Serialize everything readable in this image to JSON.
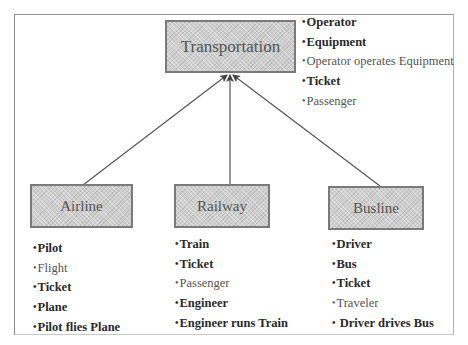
{
  "diagram": {
    "root": {
      "label": "Transportation",
      "attributes": [
        {
          "text": "Operator",
          "bold": true
        },
        {
          "text": "Equipment",
          "bold": true
        },
        {
          "text": "Operator operates Equipment",
          "bold": false
        },
        {
          "text": "Ticket",
          "bold": true
        },
        {
          "text": "Passenger",
          "bold": false
        }
      ]
    },
    "children": [
      {
        "label": "Airline",
        "attributes": [
          {
            "text": "Pilot",
            "bold": true
          },
          {
            "text": "Flight",
            "bold": false
          },
          {
            "text": "Ticket",
            "bold": true
          },
          {
            "text": "Plane",
            "bold": true
          },
          {
            "text": "Pilot flies Plane",
            "bold": true
          }
        ]
      },
      {
        "label": "Railway",
        "attributes": [
          {
            "text": "Train",
            "bold": true
          },
          {
            "text": "Ticket",
            "bold": true
          },
          {
            "text": "Passenger",
            "bold": false
          },
          {
            "text": "Engineer",
            "bold": true
          },
          {
            "text": "Engineer runs Train",
            "bold": true
          }
        ]
      },
      {
        "label": "Busline",
        "attributes": [
          {
            "text": "Driver",
            "bold": true
          },
          {
            "text": "Bus",
            "bold": true
          },
          {
            "text": "Ticket",
            "bold": true
          },
          {
            "text": "Traveler",
            "bold": false
          },
          {
            "text": " Driver drives Bus",
            "bold": true
          }
        ]
      }
    ],
    "bullet": "•",
    "edges": [
      {
        "from": "Airline",
        "to": "Transportation",
        "type": "generalization-arrow"
      },
      {
        "from": "Railway",
        "to": "Transportation",
        "type": "generalization-arrow"
      },
      {
        "from": "Busline",
        "to": "Transportation",
        "type": "generalization-arrow"
      }
    ],
    "colors": {
      "box_fill": "#cfcfcf",
      "box_border": "#7a7a7a",
      "arrow": "#555555",
      "text": "#333333"
    }
  }
}
